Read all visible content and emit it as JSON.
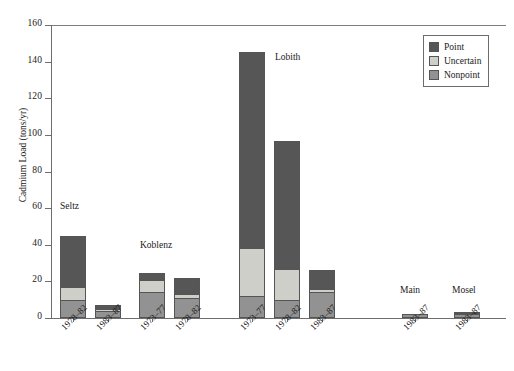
{
  "chart_data": {
    "type": "bar",
    "title": "",
    "subtitle": "",
    "xlabel": "",
    "ylabel": "Cadmium Load (tons/yr)",
    "ylim": [
      0,
      160
    ],
    "ytick_values": [
      0,
      20,
      40,
      60,
      80,
      100,
      120,
      140,
      160
    ],
    "ytick_labels": [
      "0",
      "20",
      "40",
      "60",
      "80",
      "100",
      "120",
      "140",
      "160"
    ],
    "xlim_note": "categorical, grouped by station",
    "grid": false,
    "stacked": true,
    "legend_position": "top-right",
    "legend_entries": [
      "Point",
      "Uncertain",
      "Nonpoint"
    ],
    "series": [
      {
        "name": "Nonpoint",
        "color": "#929292",
        "values": [
          10.0,
          4.0,
          14.0,
          11.0,
          12.0,
          10.0,
          14.0,
          2.0,
          2.0
        ]
      },
      {
        "name": "Uncertain",
        "color": "#cfcfc9",
        "values": [
          7.0,
          1.0,
          7.0,
          2.0,
          26.0,
          17.0,
          2.0,
          0.0,
          0.0
        ]
      },
      {
        "name": "Point",
        "color": "#565656",
        "values": [
          28.0,
          2.0,
          3.5,
          9.0,
          107.0,
          69.5,
          10.0,
          0.0,
          1.5
        ]
      }
    ],
    "categories": [
      "1978-82",
      "1983-87",
      "1973-77",
      "1978-82",
      "1973-77",
      "1978-82",
      "1983-87",
      "1983-87",
      "1983-87"
    ],
    "totals": [
      45.0,
      7.0,
      24.5,
      22.0,
      145.0,
      96.5,
      26.0,
      2.0,
      3.5
    ],
    "groups": [
      {
        "label": "Seltz",
        "category_indices": [
          0,
          1
        ]
      },
      {
        "label": "Koblenz",
        "category_indices": [
          2,
          3
        ]
      },
      {
        "label": "Lobith",
        "category_indices": [
          4,
          5,
          6
        ]
      },
      {
        "label": "Main",
        "category_indices": [
          7
        ]
      },
      {
        "label": "Mosel",
        "category_indices": [
          8
        ]
      }
    ],
    "bars": [
      {
        "group": "Seltz",
        "period": "1978–82",
        "nonpoint": 10.0,
        "uncertain": 7.0,
        "point": 28.0,
        "total": 45.0
      },
      {
        "group": "Seltz",
        "period": "1983–87",
        "nonpoint": 4.0,
        "uncertain": 1.0,
        "point": 2.0,
        "total": 7.0
      },
      {
        "group": "Koblenz",
        "period": "1973–77",
        "nonpoint": 14.0,
        "uncertain": 7.0,
        "point": 3.5,
        "total": 24.5
      },
      {
        "group": "Koblenz",
        "period": "1978–82",
        "nonpoint": 11.0,
        "uncertain": 2.0,
        "point": 9.0,
        "total": 22.0
      },
      {
        "group": "Lobith",
        "period": "1973–77",
        "nonpoint": 12.0,
        "uncertain": 26.0,
        "point": 107.0,
        "total": 145.0
      },
      {
        "group": "Lobith",
        "period": "1978–82",
        "nonpoint": 10.0,
        "uncertain": 17.0,
        "point": 69.5,
        "total": 96.5
      },
      {
        "group": "Lobith",
        "period": "1983–87",
        "nonpoint": 14.0,
        "uncertain": 2.0,
        "point": 10.0,
        "total": 26.0
      },
      {
        "group": "Main",
        "period": "1983–87",
        "nonpoint": 2.0,
        "uncertain": 0.0,
        "point": 0.0,
        "total": 2.0
      },
      {
        "group": "Mosel",
        "period": "1983–87",
        "nonpoint": 2.0,
        "uncertain": 0.0,
        "point": 1.5,
        "total": 3.5
      }
    ]
  },
  "axes": {
    "y": {
      "label": "Cadmium Load (tons/yr)",
      "ticks": [
        {
          "label": "160",
          "value": 160
        },
        {
          "label": "140",
          "value": 140
        },
        {
          "label": "120",
          "value": 120
        },
        {
          "label": "100",
          "value": 100
        },
        {
          "label": "80",
          "value": 80
        },
        {
          "label": "60",
          "value": 60
        },
        {
          "label": "40",
          "value": 40
        },
        {
          "label": "20",
          "value": 20
        },
        {
          "label": "0",
          "value": 0
        }
      ]
    },
    "x": {
      "ticks": [
        {
          "label": "1978–82"
        },
        {
          "label": "1983–87"
        },
        {
          "label": "1973–77"
        },
        {
          "label": "1978–82"
        },
        {
          "label": "1973–77"
        },
        {
          "label": "1978–82"
        },
        {
          "label": "1983–87"
        },
        {
          "label": "1983–87"
        },
        {
          "label": "1983–87"
        }
      ]
    }
  },
  "group_labels": [
    {
      "text": "Seltz"
    },
    {
      "text": "Koblenz"
    },
    {
      "text": "Lobith"
    },
    {
      "text": "Main"
    },
    {
      "text": "Mosel"
    }
  ],
  "legend": {
    "items": [
      {
        "label": "Point",
        "color": "#565656"
      },
      {
        "label": "Uncertain",
        "color": "#cfcfc9"
      },
      {
        "label": "Nonpoint",
        "color": "#929292"
      }
    ]
  },
  "colors": {
    "point": "#565656",
    "uncertain": "#cfcfc9",
    "nonpoint": "#929292",
    "axis": "#6e6e6e",
    "bar_edge": "#555555",
    "background": "#ffffff",
    "text": "#1a1a1a"
  }
}
